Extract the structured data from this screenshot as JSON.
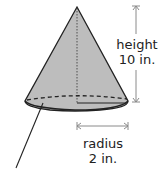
{
  "diagram": {
    "shape": "cone",
    "height": {
      "label": "height",
      "value": "10 in."
    },
    "radius": {
      "label": "radius",
      "value": "2 in."
    },
    "colors": {
      "fill": "#bdbdbd",
      "stroke": "#222222",
      "dimension": "#8a8a8a"
    }
  }
}
